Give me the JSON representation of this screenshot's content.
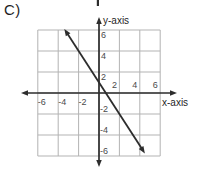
{
  "chart_data": {
    "type": "line",
    "option_label": "C)",
    "title": "",
    "xlabel": "x-axis",
    "ylabel": "y-axis",
    "x_ticks": [
      -6,
      -4,
      -2,
      2,
      4,
      6
    ],
    "y_ticks": [
      -6,
      -4,
      -2,
      2,
      4,
      6
    ],
    "grid_range": [
      -6,
      6
    ],
    "grid_step": 2,
    "grid_on": true,
    "axes_arrows": true,
    "line": {
      "slope": -1.5,
      "y_intercept": 1,
      "x_intercept": 0.67,
      "equation": "y = -3/2x + 1",
      "endpoints": [
        {
          "x": -3.4,
          "y": 6.1
        },
        {
          "x": 4.5,
          "y": -5.75
        }
      ],
      "arrow_both_ends": true
    },
    "colors": {
      "grid": "#b3b3b3",
      "axis": "#2d2d2d",
      "line": "#2d2d2d",
      "tick_text": "#4a4a4a",
      "label_text": "#1f1f1f",
      "background": "#ffffff"
    }
  },
  "artifacts": {
    "top_edge_fragment": "cropped arrow tip of figure above"
  }
}
